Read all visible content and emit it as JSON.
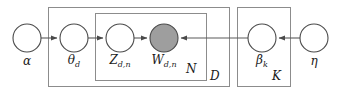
{
  "diagram": {
    "type": "plate-notation-graphical-model",
    "canvas": {
      "width": 341,
      "height": 94,
      "background": "#ffffff"
    },
    "style": {
      "node_stroke": "#4a4a4a",
      "node_fill_open": "#ffffff",
      "node_fill_observed": "#9e9e9e",
      "plate_stroke": "#8c8c8c",
      "edge_stroke": "#5a5a5a",
      "text_color": "#1a1a1a"
    },
    "nodes": [
      {
        "id": "alpha",
        "label_main": "α",
        "label_sub": "",
        "cx": 27,
        "cy": 38,
        "r": 14,
        "observed": false,
        "label_x": 27,
        "label_y": 57
      },
      {
        "id": "theta_d",
        "label_main": "θ",
        "label_sub": "d",
        "cx": 74,
        "cy": 38,
        "r": 14,
        "observed": false,
        "label_x": 74,
        "label_y": 57
      },
      {
        "id": "z_dn",
        "label_main": "Z",
        "label_sub": "d,n",
        "cx": 120,
        "cy": 38,
        "r": 14,
        "observed": false,
        "label_x": 120,
        "label_y": 57
      },
      {
        "id": "w_dn",
        "label_main": "W",
        "label_sub": "d,n",
        "cx": 164,
        "cy": 38,
        "r": 14,
        "observed": true,
        "label_x": 164,
        "label_y": 57
      },
      {
        "id": "beta_k",
        "label_main": "β",
        "label_sub": "k",
        "cx": 262,
        "cy": 38,
        "r": 14,
        "observed": false,
        "label_x": 262,
        "label_y": 57
      },
      {
        "id": "eta",
        "label_main": "η",
        "label_sub": "",
        "cx": 314,
        "cy": 38,
        "r": 14,
        "observed": false,
        "label_x": 314,
        "label_y": 57
      }
    ],
    "edges": [
      {
        "id": "alpha-to-theta",
        "from": "alpha",
        "to": "theta_d",
        "direction": "right"
      },
      {
        "id": "theta-to-z",
        "from": "theta_d",
        "to": "z_dn",
        "direction": "right"
      },
      {
        "id": "z-to-w",
        "from": "z_dn",
        "to": "w_dn",
        "direction": "right"
      },
      {
        "id": "beta-to-w",
        "from": "beta_k",
        "to": "w_dn",
        "direction": "left"
      },
      {
        "id": "eta-to-beta",
        "from": "eta",
        "to": "beta_k",
        "direction": "left"
      }
    ],
    "plates": [
      {
        "id": "plate-D",
        "label": "D",
        "x": 48,
        "y": 7,
        "width": 181,
        "height": 79,
        "label_x": 214,
        "label_y": 71
      },
      {
        "id": "plate-N",
        "label": "N",
        "x": 95,
        "y": 13,
        "width": 111,
        "height": 67,
        "label_x": 191,
        "label_y": 64
      },
      {
        "id": "plate-K",
        "label": "K",
        "x": 237,
        "y": 7,
        "width": 53,
        "height": 79,
        "label_x": 275,
        "label_y": 71
      }
    ]
  }
}
